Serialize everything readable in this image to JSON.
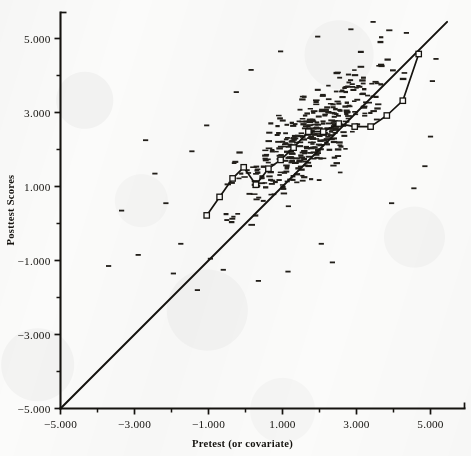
{
  "figure": {
    "background_color": "#fbfbfa",
    "ink_color": "#15130f"
  },
  "chart_data": {
    "type": "scatter",
    "title": "",
    "subtitle": "",
    "xlabel": "Pretest (or covariate)",
    "ylabel": "Posttest Scores",
    "xlim": [
      -5.4,
      5.55
    ],
    "ylim": [
      -5.4,
      5.9
    ],
    "grid": false,
    "legend": null,
    "legend_position": "none",
    "xticks": [
      -5,
      -3,
      -1,
      1,
      3,
      5
    ],
    "xticklabels": [
      "-5.000",
      "-3.000",
      "-1.000",
      "1.000",
      "3.000",
      "5.000"
    ],
    "xminor_ticks": [
      -4,
      -2,
      0,
      2,
      4
    ],
    "yticks": [
      -5,
      -3,
      -1,
      1,
      3,
      5
    ],
    "yticklabels": [
      "-5.000",
      "-3.000",
      "-1.000",
      "1.000",
      "3.000",
      "5.000"
    ],
    "yminor_ticks": [
      -4,
      -2,
      0,
      2,
      4
    ],
    "marker_style": "horizontal-dash",
    "point_count": 392,
    "annotations": [
      {
        "name": "identity-line",
        "label": "",
        "type": "line",
        "description": "45-degree reference line y = x",
        "x": [
          -5.0,
          5.45
        ],
        "y": [
          -5.0,
          5.45
        ]
      },
      {
        "name": "binned-mean-line",
        "label": "",
        "type": "polyline-with-square-markers",
        "description": "connected square markers tracing binned conditional means",
        "x": [
          -1.05,
          -0.7,
          -0.35,
          -0.05,
          0.28,
          0.62,
          0.95,
          1.3,
          1.7,
          2.1,
          2.52,
          2.95,
          3.38,
          3.82,
          4.25,
          4.68
        ],
        "y": [
          0.22,
          0.72,
          1.22,
          1.52,
          1.05,
          1.48,
          1.72,
          2.05,
          2.48,
          2.48,
          2.7,
          2.62,
          2.62,
          2.92,
          3.32,
          4.58
        ]
      }
    ],
    "series": [
      {
        "name": "observations",
        "marker": "horizontal-dash",
        "color": "#221f1a",
        "x": [
          -1.05,
          -0.92,
          -0.78,
          -0.64,
          -0.55,
          -0.44,
          -0.36,
          -0.28,
          -0.18,
          -0.09,
          -1.0,
          -0.86,
          -0.7,
          -0.58,
          -0.47,
          -0.33,
          -0.22,
          -0.12,
          -0.02,
          0.06,
          0.14,
          0.22,
          0.3,
          0.38,
          0.46,
          0.54,
          0.62,
          0.7,
          0.78,
          0.86,
          0.94,
          1.02,
          1.1,
          1.18,
          1.26,
          1.34,
          1.42,
          1.5,
          1.58,
          1.66,
          1.74,
          1.82,
          1.9,
          1.98,
          2.06,
          2.14,
          2.22,
          2.3,
          2.38,
          2.46,
          2.54,
          2.62,
          2.7,
          2.78,
          2.86,
          2.94,
          3.02,
          3.1,
          3.18,
          3.26,
          3.34,
          3.42,
          3.5,
          3.58,
          3.66,
          3.74,
          3.82,
          3.9,
          3.98,
          4.06,
          4.14,
          4.22,
          4.3,
          4.38,
          4.46,
          4.54,
          4.62,
          4.7,
          4.78,
          4.86
        ],
        "y": [
          0.2,
          0.45,
          0.7,
          0.95,
          1.2,
          1.45,
          1.7,
          1.95,
          2.2,
          2.45,
          -0.3,
          -0.05,
          0.2,
          0.45,
          0.7,
          0.95,
          1.2,
          1.45,
          1.7,
          1.95,
          2.2,
          2.45,
          2.7,
          2.95,
          3.2,
          3.45,
          3.7,
          3.95,
          4.2,
          4.45,
          0.1,
          0.35,
          0.6,
          0.85,
          1.1,
          1.35,
          1.6,
          1.85,
          2.1,
          2.35,
          2.6,
          2.85,
          3.1,
          3.35,
          3.6,
          3.85,
          4.1,
          4.35,
          4.6,
          4.85,
          0.8,
          1.05,
          1.3,
          1.55,
          1.8,
          2.05,
          2.3,
          2.55,
          2.8,
          3.05,
          3.3,
          3.55,
          3.8,
          4.05,
          4.3,
          4.55,
          4.8,
          5.05,
          1.6,
          1.85,
          2.1,
          2.35,
          2.6,
          2.85,
          3.1,
          3.35,
          3.6,
          3.85,
          4.1,
          4.35
        ]
      }
    ],
    "distribution_note": "Dense elliptical cloud of dashes centered near (1.8, 2.1) elongated along the positive diagonal; most mass lies above the identity line."
  },
  "axes": {
    "x_title": "Pretest (or covariate)",
    "y_title": "Posttest Scores",
    "x_labels": [
      "-5.000",
      "-3.000",
      "-1.000",
      "1.000",
      "3.000",
      "5.000"
    ],
    "y_labels": [
      "5.000",
      "3.000",
      "1.000",
      "-1.000",
      "-3.000",
      "-5.000"
    ]
  }
}
